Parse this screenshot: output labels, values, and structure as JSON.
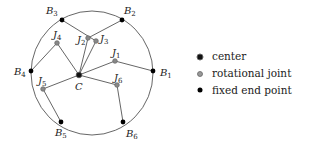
{
  "diagram": {
    "circle": {
      "cx": 92,
      "cy": 73,
      "rx": 61,
      "ry": 62
    },
    "center": {
      "id": "C",
      "label": "C",
      "x": 79,
      "y": 75,
      "lx": 75,
      "ly": 90
    },
    "joints": [
      {
        "id": "J1",
        "base": "J",
        "sub": "1",
        "x": 115,
        "y": 61,
        "lx": 112,
        "ly": 56
      },
      {
        "id": "J2",
        "base": "J",
        "sub": "2",
        "x": 88,
        "y": 38,
        "lx": 77,
        "ly": 43
      },
      {
        "id": "J3",
        "base": "J",
        "sub": "3",
        "x": 96,
        "y": 41,
        "lx": 100,
        "ly": 42
      },
      {
        "id": "J4",
        "base": "J",
        "sub": "4",
        "x": 57,
        "y": 43,
        "lx": 53,
        "ly": 38
      },
      {
        "id": "J5",
        "base": "J",
        "sub": "5",
        "x": 43,
        "y": 89,
        "lx": 38,
        "ly": 84
      },
      {
        "id": "J6",
        "base": "J",
        "sub": "6",
        "x": 117,
        "y": 85,
        "lx": 114,
        "ly": 81
      }
    ],
    "endpoints": [
      {
        "id": "B1",
        "base": "B",
        "sub": "1",
        "x": 153,
        "y": 71,
        "lx": 160,
        "ly": 76
      },
      {
        "id": "B2",
        "base": "B",
        "sub": "2",
        "x": 122,
        "y": 20,
        "lx": 124,
        "ly": 14
      },
      {
        "id": "B3",
        "base": "B",
        "sub": "3",
        "x": 62,
        "y": 20,
        "lx": 46,
        "ly": 14
      },
      {
        "id": "B4",
        "base": "B",
        "sub": "4",
        "x": 31,
        "y": 71,
        "lx": 14,
        "ly": 75
      },
      {
        "id": "B5",
        "base": "B",
        "sub": "5",
        "x": 61,
        "y": 122,
        "lx": 55,
        "ly": 136
      },
      {
        "id": "B6",
        "base": "B",
        "sub": "6",
        "x": 123,
        "y": 122,
        "lx": 126,
        "ly": 137
      }
    ],
    "links": [
      [
        "C",
        "J1"
      ],
      [
        "J1",
        "B1"
      ],
      [
        "C",
        "J2"
      ],
      [
        "J2",
        "B2"
      ],
      [
        "C",
        "J3"
      ],
      [
        "J3",
        "B3"
      ],
      [
        "C",
        "J4"
      ],
      [
        "J4",
        "B4"
      ],
      [
        "C",
        "J5"
      ],
      [
        "J5",
        "B5"
      ],
      [
        "C",
        "J6"
      ],
      [
        "J6",
        "B6"
      ]
    ]
  },
  "legend": {
    "items": [
      {
        "marker": "center",
        "label": "center"
      },
      {
        "marker": "rotational-joint",
        "label": "rotational joint"
      },
      {
        "marker": "fixed-end-point",
        "label": "fixed end point"
      }
    ]
  },
  "colors": {
    "line": "#555555",
    "center_fill": "#111111",
    "joint_fill": "#888888",
    "endpoint_fill": "#000000"
  }
}
